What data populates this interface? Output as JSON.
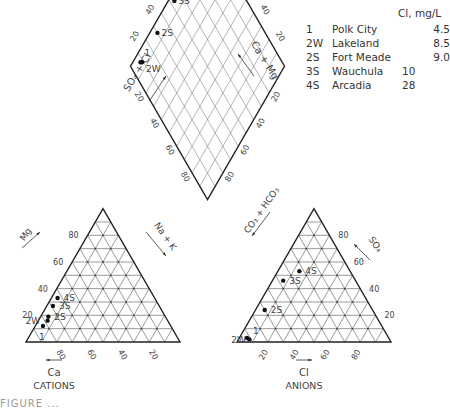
{
  "chart_data": {
    "type": "piper",
    "title": "",
    "cation_triangle": {
      "label": "CATIONS",
      "axes": {
        "bottom": {
          "label": "Ca",
          "ticks": [
            "80",
            "60",
            "40",
            "20"
          ],
          "direction": "right-to-left"
        },
        "left": {
          "label": "Mg",
          "ticks": [
            "20",
            "40",
            "60",
            "80"
          ]
        },
        "right": {
          "label": "Na + K"
        }
      }
    },
    "anion_triangle": {
      "label": "ANIONS",
      "axes": {
        "bottom": {
          "label": "Cl",
          "ticks": [
            "20",
            "40",
            "60",
            "80"
          ],
          "direction": "left-to-right"
        },
        "right": {
          "label": "SO₄",
          "ticks": [
            "20",
            "40",
            "60",
            "80"
          ]
        },
        "left": {
          "label": "CO₃ + HCO₃"
        }
      }
    },
    "diamond": {
      "upper_left_label": "SO₄ + Cl",
      "upper_right_label": "Ca + Mg",
      "lower_left_label": "Na + K",
      "lower_right_label": "CO₃ + HCO₃",
      "ticks": [
        "20",
        "40",
        "60",
        "80"
      ]
    },
    "samples": [
      {
        "id": "1",
        "name": "Polk City",
        "cl_mg_l": "4.5",
        "cations": {
          "Ca": 83,
          "Mg": 12,
          "NaK": 5
        },
        "anions": {
          "Cl": 5,
          "SO4": 3,
          "HCO3": 92
        }
      },
      {
        "id": "2W",
        "name": "Lakeland",
        "cl_mg_l": "8.5",
        "cations": {
          "Ca": 78,
          "Mg": 16,
          "NaK": 6
        },
        "anions": {
          "Cl": 7,
          "SO4": 2,
          "HCO3": 91
        }
      },
      {
        "id": "2S",
        "name": "Fort Meade",
        "cl_mg_l": "9.0",
        "cations": {
          "Ca": 76,
          "Mg": 19,
          "NaK": 5
        },
        "anions": {
          "Cl": 6,
          "SO4": 24,
          "HCO3": 70
        }
      },
      {
        "id": "3S",
        "name": "Wauchula",
        "cl_mg_l": "10",
        "cations": {
          "Ca": 69,
          "Mg": 27,
          "NaK": 4
        },
        "anions": {
          "Cl": 7,
          "SO4": 46,
          "HCO3": 47
        }
      },
      {
        "id": "4S",
        "name": "Arcadia",
        "cl_mg_l": "28",
        "cations": {
          "Ca": 63,
          "Mg": 33,
          "NaK": 4
        },
        "anions": {
          "Cl": 14,
          "SO4": 53,
          "HCO3": 33
        }
      }
    ],
    "legend": {
      "header": "Cl, mg/L",
      "position": "top-right"
    },
    "grid": true
  },
  "legend": {
    "header": "Cl, mg/L",
    "rows": [
      {
        "id": "1",
        "name": "Polk City",
        "value": "4.5"
      },
      {
        "id": "2W",
        "name": "Lakeland",
        "value": "8.5"
      },
      {
        "id": "2S",
        "name": "Fort Meade",
        "value": "9.0"
      },
      {
        "id": "3S",
        "name": "Wauchula",
        "value": "10"
      },
      {
        "id": "4S",
        "name": "Arcadia",
        "value": "28"
      }
    ]
  },
  "labels": {
    "cations": "CATIONS",
    "anions": "ANIONS",
    "ca": "Ca",
    "cl": "Cl",
    "mg": "Mg",
    "so4": "SO₄",
    "nak": "Na + K",
    "co3hco3": "CO₃ + HCO₃",
    "so4cl": "SO₄ + Cl",
    "camg": "Ca + Mg"
  },
  "caption": "FIGURE ..."
}
